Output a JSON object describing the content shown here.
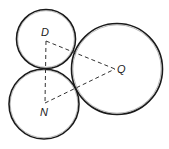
{
  "diagram": {
    "title": "",
    "circles": [
      {
        "name": "D",
        "cx": 46,
        "cy": 39,
        "r": 29.5
      },
      {
        "name": "N",
        "cx": 44,
        "cy": 104,
        "r": 35
      },
      {
        "name": "Q",
        "cx": 117,
        "cy": 69,
        "r": 45.5
      }
    ],
    "points": {
      "D": {
        "label": "D",
        "x": 46,
        "y": 41
      },
      "N": {
        "label": "N",
        "x": 45,
        "y": 103
      },
      "Q": {
        "label": "Q",
        "x": 115,
        "y": 69
      }
    },
    "segments": [
      {
        "from": "D",
        "to": "N",
        "style": "dashed"
      },
      {
        "from": "D",
        "to": "Q",
        "style": "dashed"
      },
      {
        "from": "N",
        "to": "Q",
        "style": "dashed"
      }
    ],
    "colors": {
      "stroke": "#1a1a1a",
      "background": "#ffffff"
    }
  }
}
